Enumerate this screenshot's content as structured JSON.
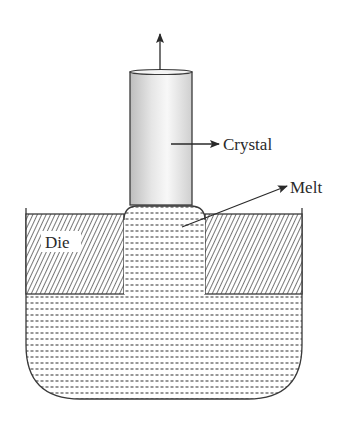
{
  "diagram": {
    "labels": {
      "crystal": "Crystal",
      "melt": "Melt",
      "die": "Die"
    },
    "colors": {
      "line": "#3a3a3a",
      "crystal_light": "#fafafa",
      "crystal_dark": "#c8c8c8",
      "hatch": "#555555",
      "melt_dash": "#6a6a6a",
      "background": "#ffffff"
    },
    "components": [
      "pull-arrow",
      "crystal",
      "die-left",
      "die-right",
      "melt-meniscus",
      "crucible-melt"
    ]
  }
}
